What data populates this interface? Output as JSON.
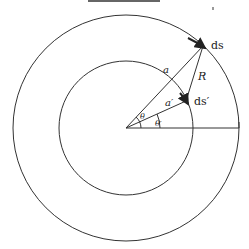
{
  "diagram": {
    "title_cropped": "",
    "center": {
      "x": 126,
      "y": 128
    },
    "outer_radius": 113,
    "inner_radius": 67,
    "labels": {
      "a": "a",
      "a_prime": "a′",
      "R": "R",
      "ds": "ds",
      "ds_prime": "ds′",
      "theta": "θ",
      "theta_prime": "θ′"
    },
    "stroke_color": "#333333"
  }
}
